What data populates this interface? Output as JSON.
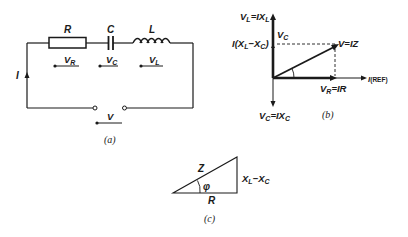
{
  "figure": {
    "circuit": {
      "caption": "(a)",
      "components": {
        "resistor": "R",
        "capacitor": "C",
        "inductor": "L"
      },
      "voltage_labels": {
        "resistor": {
          "main": "V",
          "sub": "R"
        },
        "capacitor": {
          "main": "V",
          "sub": "C"
        },
        "inductor": {
          "main": "V",
          "sub": "L"
        },
        "supply": "V"
      },
      "current_label": "I"
    },
    "phasor": {
      "caption": "(b)",
      "vl_label": {
        "a": "V",
        "a_sub": "L",
        "b": "=IX",
        "b_sub": "L"
      },
      "vc_label": {
        "a": "V",
        "a_sub": "C",
        "b": "=IX",
        "b_sub": "C"
      },
      "net_label": {
        "a": "I(X",
        "a_sub": "L",
        "b": "−X",
        "b_sub": "C",
        "c": ")"
      },
      "vc_small": {
        "a": "V",
        "a_sub": "C"
      },
      "v_label": "V=IZ",
      "vr_label": {
        "a": "V",
        "a_sub": "R",
        "b": "=IR"
      },
      "ref_label": {
        "a": "I",
        "b": "(REF)"
      }
    },
    "triangle": {
      "caption": "(c)",
      "hypotenuse": "Z",
      "angle": "φ",
      "base": "R",
      "side": {
        "a": "X",
        "a_sub": "L",
        "b": "−X",
        "b_sub": "C"
      }
    },
    "colors": {
      "ink": "#1a1a1a",
      "background": "#ffffff"
    }
  }
}
